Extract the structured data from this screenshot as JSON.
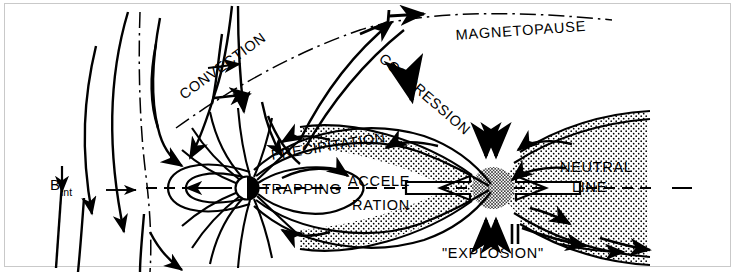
{
  "figure": {
    "kind": "schematic-diagram",
    "background_color": "#ffffff",
    "ink_color": "#000000",
    "frame_color": "#c9c9c9",
    "stipple_color": "#000000"
  },
  "labels": {
    "b_int_symbol": "B",
    "b_int_subscript": "int",
    "convection": "CONVECTION",
    "magnetopause": "MAGNETOPAUSE",
    "compression": "COMPRESSION",
    "precipitation": "PRECIPITATION",
    "trapping": "TRAPPING",
    "acceleration_line1": "ACCELE-",
    "acceleration_line2": "RATION",
    "neutral_line1": "NEUTRAL",
    "neutral_line2": "LINE",
    "explosion": "\"EXPLOSION\""
  },
  "regions": {
    "earth": {
      "name": "earth-dipole-body",
      "cx": 247,
      "cy": 188,
      "r": 11,
      "left_half": "#ffffff",
      "right_half": "#000000"
    },
    "plasma_sheet": {
      "name": "plasma-sheet-stipple",
      "description": "stippled plasma sheet narrowing to X-point then widening down-tail"
    },
    "x_point": {
      "name": "neutral-line-x-point",
      "cx": 493,
      "cy": 188,
      "r": 22
    }
  },
  "axes": {
    "sun_earth_axis_y": 188,
    "axis_style": "dashed"
  }
}
